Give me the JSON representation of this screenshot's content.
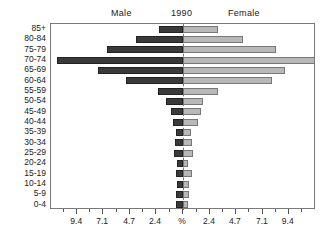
{
  "header": {
    "male_label": "Male",
    "year_label": "1990",
    "female_label": "Female"
  },
  "chart_data": {
    "type": "bar",
    "subtype": "population-pyramid",
    "title": "1990",
    "xlabel": "%",
    "ylabel": "",
    "grid": false,
    "legend_position": "top",
    "orientation": "horizontal-diverging",
    "categories": [
      "85+",
      "80-84",
      "75-79",
      "70-74",
      "65-69",
      "60-64",
      "55-59",
      "50-54",
      "45-49",
      "40-44",
      "35-39",
      "30-34",
      "25-29",
      "20-24",
      "15-19",
      "10-14",
      "5-9",
      "0-4"
    ],
    "axis_tick_labels": [
      "9.4",
      "7.1",
      "4.7",
      "2.4",
      "%",
      "2.4",
      "4.7",
      "7.1",
      "9.4"
    ],
    "axis_tick_values": [
      9.4,
      7.1,
      4.7,
      2.4,
      0,
      2.4,
      4.7,
      7.1,
      9.4
    ],
    "xlim": [
      -11.8,
      11.8
    ],
    "series": [
      {
        "name": "Male",
        "color": "#3a3a3a",
        "side": "left",
        "values": [
          2.1,
          4.2,
          6.8,
          11.2,
          7.6,
          5.1,
          2.2,
          1.5,
          1.1,
          0.9,
          0.6,
          0.7,
          0.8,
          0.5,
          0.6,
          0.5,
          0.6,
          0.6
        ]
      },
      {
        "name": "Female",
        "color": "#b8b8b8",
        "side": "right",
        "values": [
          3.1,
          5.3,
          8.3,
          11.8,
          9.1,
          7.9,
          3.1,
          1.8,
          1.6,
          1.3,
          0.7,
          0.8,
          0.9,
          0.4,
          0.8,
          0.5,
          0.5,
          0.4
        ]
      }
    ]
  }
}
